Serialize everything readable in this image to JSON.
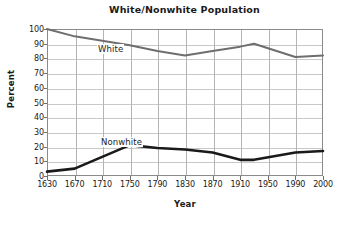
{
  "chart_data": {
    "type": "line",
    "title": "White/Nonwhite Population",
    "xlabel": "Year",
    "ylabel": "Percent",
    "categories": [
      "1630",
      "1670",
      "1710",
      "1750",
      "1790",
      "1830",
      "1870",
      "1910",
      "1950",
      "1990",
      "2000"
    ],
    "ylim": [
      0,
      100
    ],
    "ytick_labels": [
      "0",
      "10",
      "20",
      "30",
      "40",
      "50",
      "60",
      "70",
      "80",
      "90",
      "100"
    ],
    "ytick_values": [
      0,
      10,
      20,
      30,
      40,
      50,
      60,
      70,
      80,
      90,
      100
    ],
    "grid": true,
    "legend_position": "inline-on-plot",
    "series": [
      {
        "name": "White",
        "color": "#6e6e6e",
        "label": "White",
        "values": [
          100,
          95,
          92,
          89,
          85,
          82,
          85,
          88,
          90,
          81,
          82
        ],
        "vertex_x_fraction": [
          0.0,
          0.1,
          0.2,
          0.3,
          0.4,
          0.5,
          0.6,
          0.7,
          0.75,
          0.9,
          1.0
        ],
        "peak_note": "local maximum of 93 occurs between the 1910 and 1950 ticks (approx. 1930)",
        "peak_value": 93
      },
      {
        "name": "Nonwhite",
        "color": "#1a1a1a",
        "label": "Nonwhite",
        "values": [
          3,
          5,
          13,
          21,
          19,
          18,
          16,
          11,
          11,
          16,
          17
        ],
        "vertex_x_fraction": [
          0.0,
          0.1,
          0.2,
          0.3,
          0.4,
          0.5,
          0.6,
          0.7,
          0.75,
          0.9,
          1.0
        ],
        "trough_note": "flat minimum of 11 spans the 1910 tick through approx. 1930",
        "trough_value": 11
      }
    ]
  },
  "style": {
    "background": "#ffffff",
    "axis_color": "#8a8a8a",
    "gridline_color": "#c8c8c8",
    "text_color": "#1a1a1a",
    "white_series_color": "#6e6e6e",
    "nonwhite_series_color": "#1a1a1a"
  }
}
